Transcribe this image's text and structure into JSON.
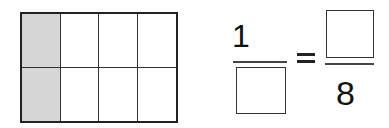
{
  "figure": {
    "grid": {
      "rows": 2,
      "columns": 4,
      "shaded_column": 1,
      "shade_color": "#d6d6d6",
      "total_parts": 8,
      "shaded_parts": 2
    },
    "equation": {
      "left_fraction": {
        "numerator": "1",
        "denominator": ""
      },
      "operator": "=",
      "right_fraction": {
        "numerator": "",
        "denominator": "8"
      }
    }
  }
}
